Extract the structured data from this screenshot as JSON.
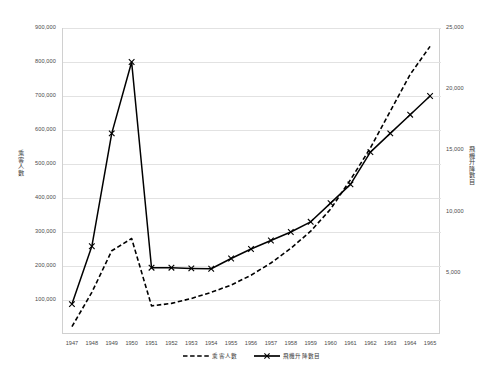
{
  "chart_data": {
    "type": "line",
    "title": "",
    "subtitle": "",
    "xlabel": "",
    "ylabel": "乘客人數",
    "y2label": "飛機升降數目",
    "grid": true,
    "legend_position": "bottom",
    "x": [
      1947,
      1948,
      1949,
      1950,
      1951,
      1952,
      1953,
      1954,
      1955,
      1956,
      1957,
      1958,
      1959,
      1960,
      1961,
      1962,
      1963,
      1964,
      1965
    ],
    "categories": [
      "1947",
      "1948",
      "1949",
      "1950",
      "1951",
      "1952",
      "1953",
      "1954",
      "1955",
      "1956",
      "1957",
      "1958",
      "1959",
      "1960",
      "1961",
      "1962",
      "1963",
      "1964",
      "1965"
    ],
    "axes": {
      "left": {
        "label": "乘客人數",
        "min": 0,
        "max": 900000,
        "step": 100000,
        "ticks": [
          0,
          100000,
          200000,
          300000,
          400000,
          500000,
          600000,
          700000,
          800000,
          900000
        ],
        "tick_labels": [
          "",
          "100,000",
          "200,000",
          "300,000",
          "400,000",
          "500,000",
          "600,000",
          "700,000",
          "800,000",
          "900,000"
        ]
      },
      "right": {
        "label": "飛機升降數目",
        "min": 0,
        "max": 25000,
        "step": 5000,
        "ticks": [
          0,
          5000,
          10000,
          15000,
          20000,
          25000
        ],
        "tick_labels": [
          "",
          "5,000",
          "10,000",
          "15,000",
          "20,000",
          "25,000"
        ]
      }
    },
    "series": [
      {
        "name": "乘客人數",
        "axis": "right",
        "style": "dashed",
        "color": "#000000",
        "marker": "none",
        "values": [
          600,
          3400,
          6800,
          7800,
          2300,
          2500,
          2900,
          3400,
          4000,
          4800,
          5800,
          7000,
          8400,
          10200,
          12600,
          15200,
          18200,
          21200,
          23500
        ]
      },
      {
        "name": "飛機升降數目",
        "axis": "left",
        "style": "solid",
        "color": "#000000",
        "marker": "x",
        "values": [
          88000,
          258000,
          590000,
          800000,
          195000,
          195000,
          193000,
          192000,
          222000,
          250000,
          275000,
          300000,
          330000,
          385000,
          440000,
          535000,
          590000,
          645000,
          700000
        ]
      }
    ],
    "legend": [
      {
        "label": "乘客人數",
        "style": "dashed"
      },
      {
        "label": "飛機升降數目",
        "style": "solid"
      }
    ]
  }
}
